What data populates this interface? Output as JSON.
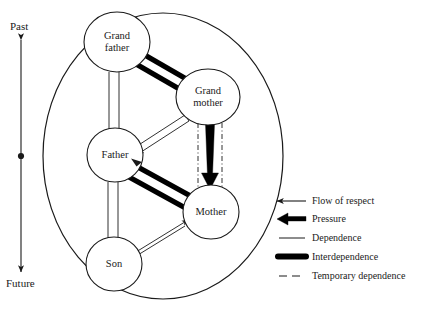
{
  "figure": {
    "colors": {
      "stroke": "#1a1a1a",
      "thick": "#000000",
      "background": "#ffffff"
    }
  },
  "time_axis": {
    "top_label": "Past",
    "bottom_label": "Future",
    "name": "time-axis"
  },
  "nodes": [
    {
      "id": "grandfather",
      "label": "Grand\nfather",
      "cx": 117,
      "cy": 42,
      "rx": 33,
      "ry": 30
    },
    {
      "id": "grandmother",
      "label": "Grand\nmother",
      "cx": 208,
      "cy": 97,
      "rx": 32,
      "ry": 28
    },
    {
      "id": "father",
      "label": "Father",
      "cx": 115,
      "cy": 155,
      "rx": 28,
      "ry": 27
    },
    {
      "id": "mother",
      "label": "Mother",
      "cx": 211,
      "cy": 212,
      "rx": 28,
      "ry": 27
    },
    {
      "id": "son",
      "label": "Son",
      "cx": 114,
      "cy": 264,
      "rx": 28,
      "ry": 27
    }
  ],
  "relations": [
    {
      "from": "grandfather",
      "to": "grandmother",
      "type": "interdependence"
    },
    {
      "from": "grandmother",
      "to": "father",
      "type": "dependence"
    },
    {
      "from": "grandmother",
      "to": "mother",
      "type": "pressure"
    },
    {
      "from": "grandmother",
      "to": "mother",
      "type": "temporary-dependence"
    },
    {
      "from": "father",
      "to": "grandfather",
      "type": "flow-of-respect"
    },
    {
      "from": "father",
      "to": "mother",
      "type": "interdependence"
    },
    {
      "from": "son",
      "to": "father",
      "type": "flow-of-respect"
    },
    {
      "from": "son",
      "to": "mother",
      "type": "dependence"
    }
  ],
  "legend": {
    "name": "legend",
    "items": [
      {
        "key": "flow-of-respect",
        "label": "Flow of respect"
      },
      {
        "key": "pressure",
        "label": "Pressure"
      },
      {
        "key": "dependence",
        "label": "Dependence"
      },
      {
        "key": "interdependence",
        "label": "Interdependence"
      },
      {
        "key": "temporary-dependence",
        "label": "Temporary dependence"
      }
    ]
  }
}
